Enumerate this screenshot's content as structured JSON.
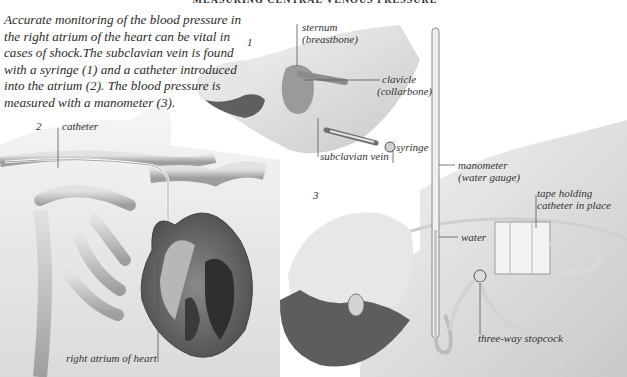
{
  "page": {
    "title": "MEASURING CENTRAL VENOUS PRESSURE",
    "caption": "Accurate monitoring of the blood pressure in the right atrium of the heart can be vital in cases of shock.The subclavian vein is found with a syringe (1) and a catheter introduced into the atrium (2). The blood pressure is measured with a manometer (3)."
  },
  "figures": {
    "fig1": {
      "number": "1",
      "labels": {
        "sternum": "sternum",
        "sternum_alt": "(breastbone)",
        "clavicle": "clavicle",
        "clavicle_alt": "(collarbone)",
        "subclavian_vein": "subclavian vein",
        "syringe": "syringe"
      }
    },
    "fig2": {
      "number": "2",
      "labels": {
        "catheter": "catheter",
        "right_atrium": "right atrium of heart"
      }
    },
    "fig3": {
      "number": "3",
      "labels": {
        "manometer": "manometer",
        "manometer_alt": "(water gauge)",
        "tape": "tape holding",
        "tape_alt": "catheter in place",
        "water": "water",
        "stopcock": "three-way stopcock"
      }
    }
  }
}
